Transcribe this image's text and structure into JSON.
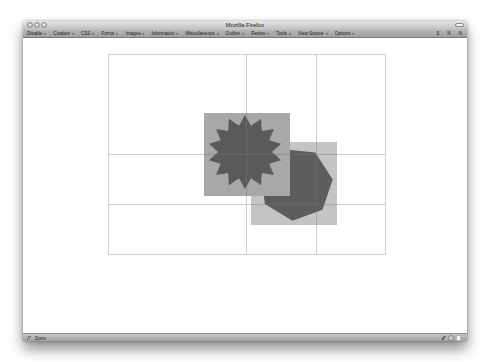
{
  "window": {
    "title": "Mozilla Firefox",
    "traffic_lights": [
      "close",
      "minimize",
      "zoom"
    ]
  },
  "toolbar": {
    "menus": [
      {
        "label": "Disable"
      },
      {
        "label": "Cookies"
      },
      {
        "label": "CSS"
      },
      {
        "label": "Forms"
      },
      {
        "label": "Images"
      },
      {
        "label": "Information"
      },
      {
        "label": "Miscellaneous"
      },
      {
        "label": "Outline"
      },
      {
        "label": "Resize"
      },
      {
        "label": "Tools"
      },
      {
        "label": "View Source"
      },
      {
        "label": "Options"
      }
    ],
    "menu_arrow": "▾",
    "right_items": [
      "S",
      "N",
      "N"
    ]
  },
  "canvas": {
    "frame_color": "#cfcfcf",
    "grid_color": "#c8c8c8",
    "square_color": "#a3a3a3",
    "shape_color": "#5a5a5a",
    "shapes": [
      "starburst",
      "heptagon"
    ]
  },
  "statusbar": {
    "text": "Done",
    "icons": [
      "web-developer-icon",
      "clock-icon",
      "page-icon"
    ]
  }
}
